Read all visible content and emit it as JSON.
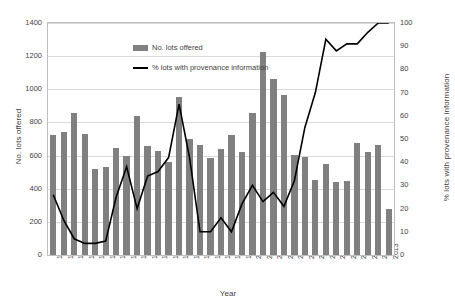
{
  "chart_data": {
    "type": "bar",
    "title": "",
    "xlabel": "Year",
    "ylabel": "No. lots offered",
    "y2label": "% lots with provenance information",
    "ylim": [
      0,
      1400
    ],
    "y2lim": [
      0,
      100
    ],
    "grid": true,
    "legend_position": "top-center-inside",
    "categories": [
      "1981",
      "1982",
      "1983",
      "1984",
      "1985",
      "1986",
      "1987",
      "1988",
      "1989",
      "1990",
      "1991",
      "1992",
      "1993",
      "1994",
      "1995",
      "1996",
      "1997",
      "1998",
      "1999",
      "2000",
      "2001",
      "2002",
      "2003",
      "2004",
      "2005",
      "2006",
      "2007",
      "2008",
      "2009",
      "2010",
      "2011",
      "2012",
      "2013"
    ],
    "y_ticks": [
      0,
      200,
      400,
      600,
      800,
      1000,
      1200,
      1400
    ],
    "y2_ticks": [
      0,
      10,
      20,
      30,
      40,
      50,
      60,
      70,
      80,
      90,
      100
    ],
    "series": [
      {
        "name": "No. lots offered",
        "type": "bar",
        "axis": "left",
        "color": "#808080",
        "values": [
          725,
          740,
          855,
          730,
          520,
          530,
          645,
          600,
          840,
          660,
          630,
          560,
          955,
          700,
          665,
          585,
          640,
          725,
          620,
          855,
          1225,
          1060,
          965,
          605,
          590,
          450,
          550,
          440,
          445,
          675,
          620,
          665,
          280
        ]
      },
      {
        "name": "% lots with provenance information",
        "type": "line",
        "axis": "right",
        "color": "#000000",
        "values": [
          26,
          15,
          7,
          5,
          5,
          6,
          25,
          38,
          20,
          34,
          36,
          42,
          65,
          42,
          10,
          10,
          16,
          10,
          22,
          30,
          23,
          27,
          21,
          32,
          55,
          70,
          93,
          88,
          91,
          91,
          96,
          100,
          100
        ]
      }
    ]
  },
  "legend": {
    "items": [
      {
        "label": "No. lots offered",
        "marker": "bar-swatch"
      },
      {
        "label": "% lots with provenance information",
        "marker": "line-swatch"
      }
    ]
  }
}
